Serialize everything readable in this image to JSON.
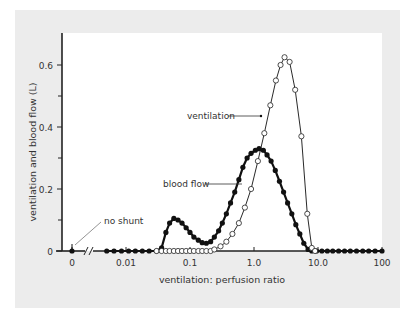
{
  "chart_data": {
    "type": "line",
    "title": "",
    "xlabel": "ventilation: perfusion ratio",
    "ylabel": "ventilation and blood flow (L)",
    "xscale": "log",
    "xlim": [
      0.005,
      100
    ],
    "ylim": [
      0,
      0.68
    ],
    "x_ticks": [
      {
        "label": "0",
        "value": 0
      },
      {
        "label": "0.01",
        "value": 0.01
      },
      {
        "label": "0.1",
        "value": 0.1
      },
      {
        "label": "1.0",
        "value": 1.0
      },
      {
        "label": "10.0",
        "value": 10.0
      },
      {
        "label": "100",
        "value": 100
      }
    ],
    "y_ticks": [
      {
        "label": "0",
        "value": 0
      },
      {
        "label": "0.2",
        "value": 0.2
      },
      {
        "label": "0.4",
        "value": 0.4
      },
      {
        "label": "0.6",
        "value": 0.6
      }
    ],
    "y_minor_ticks": [
      0.1,
      0.3,
      0.5
    ],
    "grid": false,
    "legend": "inline annotations",
    "annotations": [
      {
        "text": "no shunt",
        "points_to": {
          "x": 0,
          "y": 0
        }
      },
      {
        "text": "ventilation",
        "series": "ventilation"
      },
      {
        "text": "blood flow",
        "series": "blood flow"
      }
    ],
    "axis_break": {
      "between": [
        0,
        0.01
      ]
    },
    "series": [
      {
        "name": "blood flow",
        "marker": "filled circle",
        "line_weight": "thick",
        "zero_point": {
          "x": 0,
          "y": 0
        },
        "x": [
          0.005,
          0.0065,
          0.0085,
          0.011,
          0.014,
          0.018,
          0.023,
          0.03,
          0.036,
          0.042,
          0.048,
          0.056,
          0.065,
          0.075,
          0.087,
          0.1,
          0.115,
          0.135,
          0.155,
          0.18,
          0.21,
          0.24,
          0.28,
          0.32,
          0.37,
          0.43,
          0.5,
          0.58,
          0.67,
          0.78,
          0.9,
          1.05,
          1.2,
          1.4,
          1.6,
          1.85,
          2.15,
          2.5,
          2.9,
          3.35,
          3.9,
          4.5,
          5.2,
          6.0,
          7.0,
          8.0,
          9.5,
          11.5,
          14,
          17,
          21,
          26,
          32,
          40,
          50,
          62,
          78,
          100
        ],
        "y": [
          0,
          0,
          0,
          0,
          0,
          0,
          0,
          0,
          0.01,
          0.06,
          0.09,
          0.105,
          0.1,
          0.09,
          0.075,
          0.06,
          0.045,
          0.035,
          0.027,
          0.025,
          0.03,
          0.045,
          0.065,
          0.09,
          0.12,
          0.155,
          0.19,
          0.23,
          0.27,
          0.3,
          0.315,
          0.325,
          0.33,
          0.325,
          0.31,
          0.29,
          0.26,
          0.225,
          0.19,
          0.155,
          0.12,
          0.085,
          0.055,
          0.025,
          0.005,
          0,
          0,
          0,
          0,
          0,
          0,
          0,
          0,
          0,
          0,
          0,
          0,
          0
        ]
      },
      {
        "name": "ventilation",
        "marker": "open circle",
        "line_weight": "thin",
        "x": [
          0.03,
          0.036,
          0.042,
          0.048,
          0.056,
          0.065,
          0.075,
          0.087,
          0.1,
          0.115,
          0.135,
          0.155,
          0.18,
          0.21,
          0.24,
          0.3,
          0.37,
          0.46,
          0.58,
          0.72,
          0.9,
          1.15,
          1.45,
          1.8,
          2.2,
          2.6,
          3.0,
          3.6,
          4.4,
          5.5,
          6.8,
          8.0,
          9.0
        ],
        "y": [
          0,
          0,
          0,
          0,
          0,
          0,
          0,
          0,
          0,
          0,
          0,
          0,
          0,
          0,
          0.005,
          0.015,
          0.03,
          0.055,
          0.09,
          0.14,
          0.2,
          0.29,
          0.38,
          0.47,
          0.55,
          0.6,
          0.625,
          0.61,
          0.52,
          0.37,
          0.12,
          0.01,
          0
        ]
      }
    ]
  }
}
